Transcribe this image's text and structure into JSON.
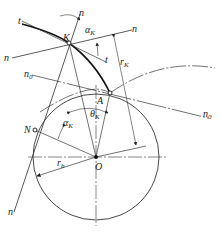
{
  "diagram": {
    "labels": {
      "K": "K",
      "A": "A",
      "N": "N",
      "O": "O",
      "t_top": "t",
      "t_bottom": "t",
      "n_top": "n",
      "n_left": "n",
      "n_right": "n",
      "n_bottom": "n",
      "n0_left": "n",
      "n0_left_sub": "0",
      "n0_right": "n",
      "n0_right_sub": "0",
      "alpha_top": "α",
      "alpha_top_sub": "K",
      "alpha_left": "α",
      "alpha_left_sub": "K",
      "theta": "θ",
      "theta_sub": "K",
      "rK": "r",
      "rK_sub": "K",
      "rb": "r",
      "rb_sub": "b"
    },
    "points": {
      "O": [
        96,
        157
      ],
      "K": [
        69,
        43
      ],
      "A": [
        110,
        93
      ],
      "N": [
        35,
        130
      ]
    },
    "base_circle_radius": 63,
    "line_color": "#333333"
  }
}
